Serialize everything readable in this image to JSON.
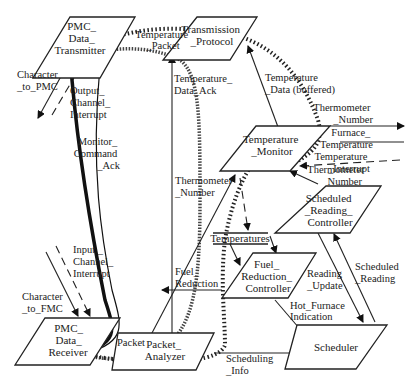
{
  "diagram": {
    "nodes": [
      {
        "id": "pmc_data_transmitter",
        "lines": [
          "PMC_",
          "Data_",
          "Transmitter"
        ]
      },
      {
        "id": "transmission_protocol",
        "lines": [
          "Transmission",
          "_Protocol"
        ]
      },
      {
        "id": "temperature_monitor",
        "lines": [
          "Temperature",
          "_Monitor"
        ]
      },
      {
        "id": "scheduled_reading_controller",
        "lines": [
          "Scheduled",
          "_Reading_",
          "Controller"
        ]
      },
      {
        "id": "fuel_reduction_controller",
        "lines": [
          "Fuel_",
          "Reduction_",
          "Controller"
        ]
      },
      {
        "id": "scheduler",
        "lines": [
          "Scheduler"
        ]
      },
      {
        "id": "pmc_data_receiver",
        "lines": [
          "PMC_",
          "Data_",
          "Receiver"
        ]
      },
      {
        "id": "packet_analyzer",
        "lines": [
          "Packet_",
          "Analyzer"
        ]
      }
    ],
    "stores": [
      {
        "id": "temperatures",
        "label": "Temperatures"
      }
    ],
    "flows": [
      {
        "id": "character_to_pmc",
        "lines": [
          "Character",
          "_to_PMC"
        ]
      },
      {
        "id": "output_channel_interrupt",
        "lines": [
          "Output_",
          "Channel_",
          "Interrupt"
        ]
      },
      {
        "id": "temperature_packet",
        "lines": [
          "Temperature",
          "_Packet"
        ]
      },
      {
        "id": "temperature_data_ack",
        "lines": [
          "Temperature_",
          "Data_Ack"
        ]
      },
      {
        "id": "temperature_data_buffered",
        "lines": [
          "Temperature",
          "_Data (buffered)"
        ]
      },
      {
        "id": "monitor_command_ack",
        "lines": [
          "Monitor_",
          "Command",
          "_Ack"
        ]
      },
      {
        "id": "thermometer_number_out",
        "lines": [
          "Thermometer",
          "_Number"
        ]
      },
      {
        "id": "furnace_temperature",
        "lines": [
          "Furnace_",
          "Temperature"
        ]
      },
      {
        "id": "temperature_interrupt",
        "lines": [
          "Temperature",
          "_Interrupt"
        ]
      },
      {
        "id": "thermometer_number_in",
        "lines": [
          "Thermometer",
          "Number"
        ]
      },
      {
        "id": "thermometer_number_mid",
        "lines": [
          "Thermometer",
          "_Number"
        ]
      },
      {
        "id": "input_channel_interrupt",
        "lines": [
          "Input _",
          "Channel_",
          "Interrupt"
        ]
      },
      {
        "id": "character_to_fmc",
        "lines": [
          "Character",
          "_to_FMC"
        ]
      },
      {
        "id": "fuel_reduction",
        "lines": [
          "Fuel_",
          "Reduction"
        ]
      },
      {
        "id": "reading_update",
        "lines": [
          "Reading",
          "_Update"
        ]
      },
      {
        "id": "scheduled_reading",
        "lines": [
          "Scheduled",
          "_Reading"
        ]
      },
      {
        "id": "hot_furnace_indication",
        "lines": [
          "Hot_Furnace",
          "Indication"
        ]
      },
      {
        "id": "scheduling_info",
        "lines": [
          "Scheduling",
          "_Info"
        ]
      },
      {
        "id": "packet",
        "lines": [
          "Packet"
        ]
      }
    ]
  }
}
